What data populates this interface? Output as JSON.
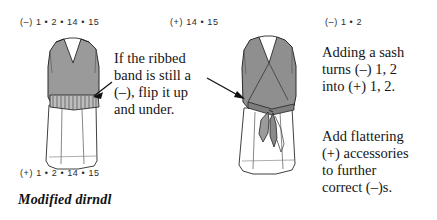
{
  "caption": "Modified dirndl",
  "labels": {
    "left_top": "(–) 1 • 2 • 14 • 15",
    "middle_top": "(+) 14 • 15",
    "right_top": "(–) 1 • 2",
    "left_bottom": "(+) 1 • 2 • 14 • 15"
  },
  "text_blocks": {
    "center": "If the ribbed\nband is still a\n(–), flip it up\nand under.",
    "right_top": "Adding a sash\nturns (–) 1, 2\ninto (+) 1, 2.",
    "right_bottom": "Add flattering\n(+) accessories\nto further\ncorrect (–)s."
  },
  "figures": {
    "left": {
      "name": "dirndl-with-ribbed-band",
      "garment_fill": "#9a9a9a",
      "skirt_fill": "#ffffff",
      "outline": "#2a2a2a",
      "band_label": "ribbed-band"
    },
    "right": {
      "name": "dirndl-with-sash",
      "garment_fill": "#8f8f8f",
      "skirt_fill": "#ffffff",
      "outline": "#2a2a2a",
      "sash_label": "sash-tie"
    }
  },
  "arrows": [
    {
      "name": "arrow-to-ribbed-band",
      "direction": "left"
    },
    {
      "name": "arrow-to-sash",
      "direction": "right"
    }
  ],
  "colors": {
    "ink": "#161616",
    "garment_gray": "#9a9a9a",
    "outline": "#2a2a2a",
    "paper": "#ffffff"
  }
}
